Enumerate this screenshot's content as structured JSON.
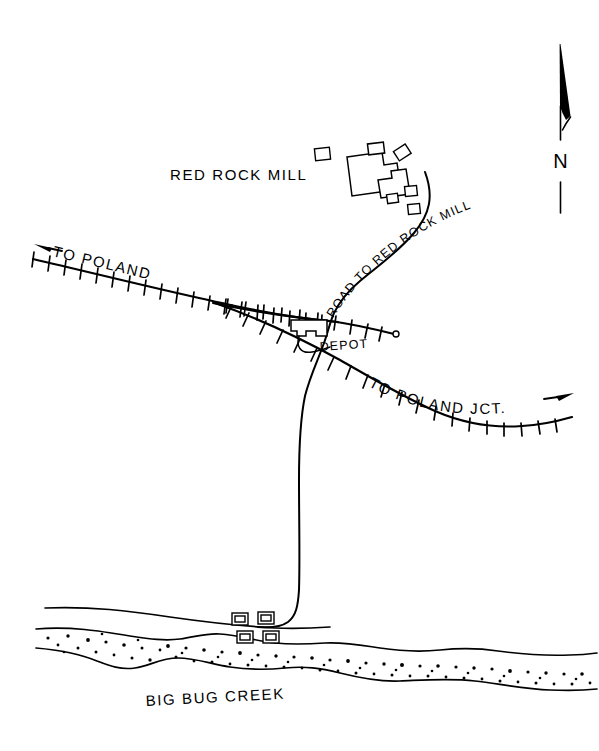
{
  "map": {
    "title_label": "RED ROCK MILL",
    "labels": {
      "mill": "RED ROCK MILL",
      "road_to_mill": "ROAD TO RED ROCK MILL",
      "to_poland": "TO POLAND",
      "to_poland_jct": "TO POLAND JCT.",
      "depot": "DEPOT",
      "creek": "BIG BUG CREEK",
      "north": "N"
    },
    "colors": {
      "ink": "#000000",
      "paper": "#ffffff"
    },
    "features": [
      {
        "name": "red-rock-mill-complex",
        "type": "building-cluster",
        "label": "RED ROCK MILL",
        "count": 10
      },
      {
        "name": "mill-road",
        "type": "road",
        "label": "ROAD TO RED ROCK MILL"
      },
      {
        "name": "mainline-west",
        "type": "railroad",
        "label": "TO POLAND"
      },
      {
        "name": "mainline-east",
        "type": "railroad",
        "label": "TO POLAND JCT."
      },
      {
        "name": "depot-siding",
        "type": "railroad-siding",
        "label": ""
      },
      {
        "name": "depot-building",
        "type": "building",
        "label": "DEPOT"
      },
      {
        "name": "creek",
        "type": "watercourse",
        "label": "BIG BUG CREEK"
      },
      {
        "name": "creek-buildings",
        "type": "building-cluster",
        "label": "",
        "count": 4
      }
    ],
    "compass": {
      "direction": "N",
      "label": "N"
    },
    "direction_arrows": [
      {
        "name": "to-poland-arrow",
        "points": "west"
      },
      {
        "name": "to-poland-jct-arrow",
        "points": "east"
      }
    ]
  }
}
